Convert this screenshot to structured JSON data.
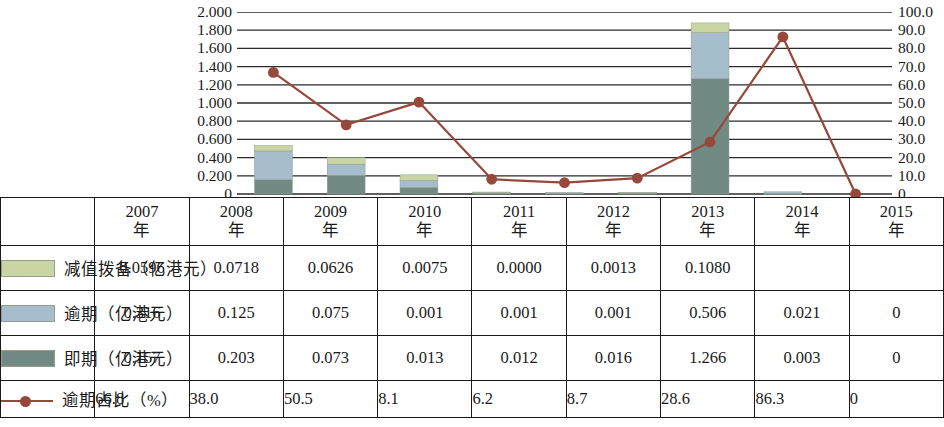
{
  "chart_data": {
    "type": "bar",
    "title": "",
    "subtitle": "",
    "xlabel": "",
    "ylabel": "",
    "categories": [
      "2007年",
      "2008年",
      "2009年",
      "2010年",
      "2011年",
      "2012年",
      "2013年",
      "2014年",
      "2015年"
    ],
    "grid": true,
    "legend_position": "table-left",
    "stacked": true,
    "left_axis": {
      "label": "",
      "ylim": [
        0,
        2.0
      ],
      "ticks": [
        "2.000",
        "1.800",
        "1.600",
        "1.400",
        "1.200",
        "1.000",
        "0.800",
        "0.600",
        "0.400",
        "0.200",
        "0"
      ],
      "tick_values": [
        2.0,
        1.8,
        1.6,
        1.4,
        1.2,
        1.0,
        0.8,
        0.6,
        0.4,
        0.2,
        0
      ]
    },
    "right_axis": {
      "label": "",
      "ylim": [
        0,
        100
      ],
      "ticks": [
        "100.0",
        "90.0",
        "80.0",
        "70.0",
        "60.0",
        "50.0",
        "40.0",
        "30.0",
        "20.0",
        "10.0",
        "0"
      ],
      "tick_values": [
        100,
        90,
        80,
        70,
        60,
        50,
        40,
        30,
        20,
        10,
        0
      ]
    },
    "series": [
      {
        "name": "即期（亿港元）",
        "kind": "bar",
        "axis": "left",
        "color": "#728a84",
        "values": [
          0.157,
          0.203,
          0.073,
          0.013,
          0.012,
          0.016,
          1.266,
          0.003,
          0
        ]
      },
      {
        "name": "逾期（亿港元）",
        "kind": "bar",
        "axis": "left",
        "color": "#a6bdcc",
        "values": [
          0.316,
          0.125,
          0.075,
          0.001,
          0.001,
          0.001,
          0.506,
          0.021,
          0
        ]
      },
      {
        "name": "减值拨备（亿港元）",
        "kind": "bar",
        "axis": "left",
        "color": "#cad5a4",
        "values": [
          0.0596,
          0.0718,
          0.0626,
          0.0075,
          0.0,
          0.0013,
          0.108,
          null,
          null
        ]
      },
      {
        "name": "逾期占比（%）",
        "kind": "line",
        "axis": "right",
        "color": "#96483b",
        "values": [
          66.8,
          38.0,
          50.5,
          8.1,
          6.2,
          8.7,
          28.6,
          86.3,
          0
        ]
      }
    ]
  },
  "table": {
    "corner": "",
    "year_headers": [
      {
        "year": "2007",
        "unit": "年"
      },
      {
        "year": "2008",
        "unit": "年"
      },
      {
        "year": "2009",
        "unit": "年"
      },
      {
        "year": "2010",
        "unit": "年"
      },
      {
        "year": "2011",
        "unit": "年"
      },
      {
        "year": "2012",
        "unit": "年"
      },
      {
        "year": "2013",
        "unit": "年"
      },
      {
        "year": "2014",
        "unit": "年"
      },
      {
        "year": "2015",
        "unit": "年"
      }
    ],
    "rows": [
      {
        "label": "减值拨备（亿港元）",
        "swatch": "#cad5a4",
        "marker": "swatch",
        "align": "center",
        "cells": [
          "0.0596",
          "0.0718",
          "0.0626",
          "0.0075",
          "0.0000",
          "0.0013",
          "0.1080",
          "",
          ""
        ]
      },
      {
        "label": "逾期（亿港元）",
        "swatch": "#a6bdcc",
        "marker": "swatch",
        "align": "center",
        "cells": [
          "0.316",
          "0.125",
          "0.075",
          "0.001",
          "0.001",
          "0.001",
          "0.506",
          "0.021",
          "0"
        ]
      },
      {
        "label": "即期（亿港元）",
        "swatch": "#728a84",
        "marker": "swatch",
        "align": "center",
        "cells": [
          "0.157",
          "0.203",
          "0.073",
          "0.013",
          "0.012",
          "0.016",
          "1.266",
          "0.003",
          "0"
        ]
      },
      {
        "label": "逾期占比（%）",
        "swatch": "#96483b",
        "marker": "line",
        "align": "left",
        "cells": [
          "66.8",
          "38.0",
          "50.5",
          "8.1",
          "6.2",
          "8.7",
          "28.6",
          "86.3",
          "0"
        ]
      }
    ]
  },
  "colors": {
    "impairment": "#cad5a4",
    "overdue": "#a6bdcc",
    "current": "#728a84",
    "ratio_line": "#96483b",
    "gridline": "#2b2b2b",
    "border": "#1a1a1a"
  }
}
